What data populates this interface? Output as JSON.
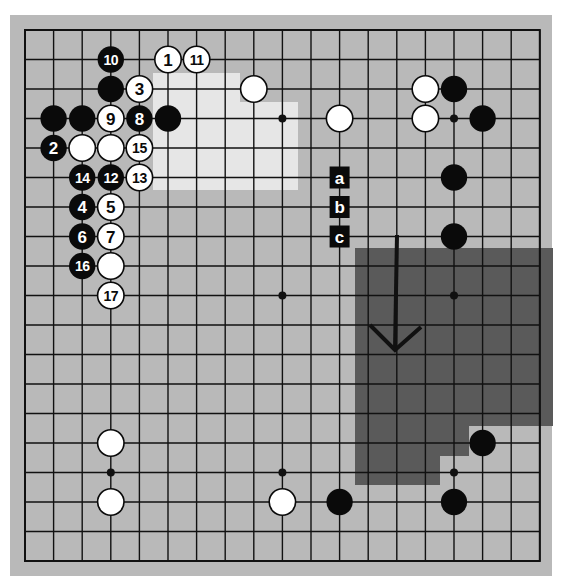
{
  "diagram": {
    "type": "go-board",
    "size": 19,
    "board": {
      "x": 10,
      "y": 15,
      "width": 542,
      "height": 561,
      "color": "#b9b9b9"
    },
    "grid": {
      "x0": 25,
      "y0": 30,
      "dx": 28.6,
      "dy": 29.5,
      "line_color": "#111111",
      "line_width": 1.4
    },
    "colors": {
      "black_stone": "#0a0a0a",
      "white_stone": "#ffffff",
      "light_region": "#e6e6e6",
      "dark_region": "#5a5a5a",
      "label_bg": "#0a0a0a",
      "label_text": "#ffffff"
    },
    "star_points": [
      [
        3,
        3
      ],
      [
        9,
        3
      ],
      [
        15,
        3
      ],
      [
        3,
        9
      ],
      [
        9,
        9
      ],
      [
        15,
        9
      ],
      [
        3,
        15
      ],
      [
        9,
        15
      ],
      [
        15,
        15
      ]
    ],
    "regions": [
      {
        "name": "light-region",
        "fill": "#e6e6e6",
        "points": [
          [
            153,
            73
          ],
          [
            240,
            73
          ],
          [
            240,
            102
          ],
          [
            298,
            102
          ],
          [
            298,
            190
          ],
          [
            153,
            190
          ]
        ]
      },
      {
        "name": "dark-region",
        "fill": "#5a5a5a",
        "points": [
          [
            355,
            248
          ],
          [
            553,
            248
          ],
          [
            553,
            426
          ],
          [
            469,
            426
          ],
          [
            469,
            456
          ],
          [
            440,
            456
          ],
          [
            440,
            485
          ],
          [
            355,
            485
          ]
        ]
      }
    ],
    "stones": [
      {
        "color": "black",
        "col": 3,
        "row": 1,
        "label": "10"
      },
      {
        "color": "white",
        "col": 5,
        "row": 1,
        "label": "1"
      },
      {
        "color": "white",
        "col": 6,
        "row": 1,
        "label": "11"
      },
      {
        "color": "black",
        "col": 3,
        "row": 2,
        "label": ""
      },
      {
        "color": "white",
        "col": 4,
        "row": 2,
        "label": "3"
      },
      {
        "color": "white",
        "col": 8,
        "row": 2,
        "label": ""
      },
      {
        "color": "white",
        "col": 14,
        "row": 2,
        "label": ""
      },
      {
        "color": "black",
        "col": 15,
        "row": 2,
        "label": ""
      },
      {
        "color": "black",
        "col": 1,
        "row": 3,
        "label": ""
      },
      {
        "color": "black",
        "col": 2,
        "row": 3,
        "label": ""
      },
      {
        "color": "white",
        "col": 3,
        "row": 3,
        "label": "9"
      },
      {
        "color": "black",
        "col": 4,
        "row": 3,
        "label": "8"
      },
      {
        "color": "black",
        "col": 5,
        "row": 3,
        "label": ""
      },
      {
        "color": "white",
        "col": 11,
        "row": 3,
        "label": ""
      },
      {
        "color": "white",
        "col": 14,
        "row": 3,
        "label": ""
      },
      {
        "color": "black",
        "col": 16,
        "row": 3,
        "label": ""
      },
      {
        "color": "black",
        "col": 1,
        "row": 4,
        "label": "2"
      },
      {
        "color": "white",
        "col": 2,
        "row": 4,
        "label": ""
      },
      {
        "color": "white",
        "col": 3,
        "row": 4,
        "label": ""
      },
      {
        "color": "white",
        "col": 4,
        "row": 4,
        "label": "15"
      },
      {
        "color": "black",
        "col": 2,
        "row": 5,
        "label": "14"
      },
      {
        "color": "black",
        "col": 3,
        "row": 5,
        "label": "12"
      },
      {
        "color": "white",
        "col": 4,
        "row": 5,
        "label": "13"
      },
      {
        "color": "black",
        "col": 15,
        "row": 5,
        "label": ""
      },
      {
        "color": "black",
        "col": 2,
        "row": 6,
        "label": "4"
      },
      {
        "color": "white",
        "col": 3,
        "row": 6,
        "label": "5"
      },
      {
        "color": "black",
        "col": 2,
        "row": 7,
        "label": "6"
      },
      {
        "color": "white",
        "col": 3,
        "row": 7,
        "label": "7"
      },
      {
        "color": "black",
        "col": 15,
        "row": 7,
        "label": ""
      },
      {
        "color": "black",
        "col": 2,
        "row": 8,
        "label": "16"
      },
      {
        "color": "white",
        "col": 3,
        "row": 8,
        "label": ""
      },
      {
        "color": "white",
        "col": 3,
        "row": 9,
        "label": "17"
      },
      {
        "color": "white",
        "col": 3,
        "row": 14,
        "label": ""
      },
      {
        "color": "black",
        "col": 16,
        "row": 14,
        "label": ""
      },
      {
        "color": "white",
        "col": 3,
        "row": 16,
        "label": ""
      },
      {
        "color": "white",
        "col": 9,
        "row": 16,
        "label": ""
      },
      {
        "color": "black",
        "col": 11,
        "row": 16,
        "label": ""
      },
      {
        "color": "black",
        "col": 15,
        "row": 16,
        "label": ""
      }
    ],
    "point_labels": [
      {
        "col": 11,
        "row": 5,
        "text": "a"
      },
      {
        "col": 11,
        "row": 6,
        "text": "b"
      },
      {
        "col": 11,
        "row": 7,
        "text": "c"
      }
    ],
    "arrow": {
      "name": "down-arrow",
      "shaft": [
        [
          397,
          235
        ],
        [
          395,
          350
        ]
      ],
      "head": [
        [
          370,
          325
        ],
        [
          395,
          350
        ],
        [
          421,
          327
        ]
      ],
      "color": "#111111",
      "width": 4
    }
  }
}
